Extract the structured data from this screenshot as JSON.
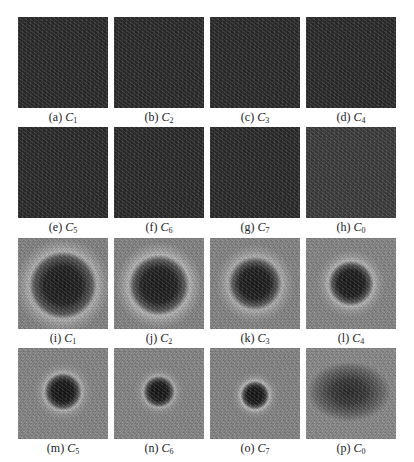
{
  "figure": {
    "rows": [
      {
        "kind": "dark-uniform",
        "panels": [
          {
            "letter": "(a)",
            "var": "C",
            "sub": "1"
          },
          {
            "letter": "(b)",
            "var": "C",
            "sub": "2"
          },
          {
            "letter": "(c)",
            "var": "C",
            "sub": "3"
          },
          {
            "letter": "(d)",
            "var": "C",
            "sub": "4"
          }
        ]
      },
      {
        "kind": "dark-uniform",
        "panels": [
          {
            "letter": "(e)",
            "var": "C",
            "sub": "5"
          },
          {
            "letter": "(f)",
            "var": "C",
            "sub": "6"
          },
          {
            "letter": "(g)",
            "var": "C",
            "sub": "7"
          },
          {
            "letter": "(h)",
            "var": "C",
            "sub": "0"
          }
        ]
      },
      {
        "kind": "noisy-dark-center",
        "panels": [
          {
            "letter": "(i)",
            "var": "C",
            "sub": "1"
          },
          {
            "letter": "(j)",
            "var": "C",
            "sub": "2"
          },
          {
            "letter": "(k)",
            "var": "C",
            "sub": "3"
          },
          {
            "letter": "(l)",
            "var": "C",
            "sub": "4"
          }
        ]
      },
      {
        "kind": "noisy-dark-center",
        "panels": [
          {
            "letter": "(m)",
            "var": "C",
            "sub": "5"
          },
          {
            "letter": "(n)",
            "var": "C",
            "sub": "6"
          },
          {
            "letter": "(o)",
            "var": "C",
            "sub": "7"
          },
          {
            "letter": "(p)",
            "var": "C",
            "sub": "0"
          }
        ]
      }
    ]
  }
}
